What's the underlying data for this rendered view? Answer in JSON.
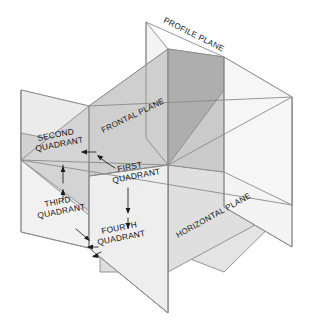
{
  "diagram": {
    "background_color": "#ffffff",
    "outline_color": "#8a8a8a",
    "text_color": "#1a1a1a",
    "planes": [
      {
        "id": "profile-plane",
        "label": "PROFILE PLANE",
        "fill": "#f2f2f2",
        "label_rotation": -28
      },
      {
        "id": "frontal-plane",
        "label": "FRONTAL PLANE",
        "fill": "#e6e6e6",
        "label_rotation": -28
      },
      {
        "id": "horizontal-plane",
        "label": "HORIZONTAL PLANE",
        "fill": "#d9d9d9",
        "label_rotation": -28
      }
    ],
    "shades": {
      "lightest": "#f4f4f4",
      "light": "#ededed",
      "mid_light": "#e2e2e2",
      "mid": "#d6d6d6",
      "mid_dark": "#c8c8c8",
      "dark": "#b4b4b4",
      "darkest": "#a8a8a8"
    },
    "quadrants": [
      {
        "id": "first-quadrant",
        "line1": "FIRST",
        "line2": "QUADRANT"
      },
      {
        "id": "second-quadrant",
        "line1": "SECOND",
        "line2": "QUADRANT"
      },
      {
        "id": "third-quadrant",
        "line1": "THIRD",
        "line2": "QUADRANT"
      },
      {
        "id": "fourth-quadrant",
        "line1": "FOURTH",
        "line2": "QUADRANT"
      }
    ]
  }
}
